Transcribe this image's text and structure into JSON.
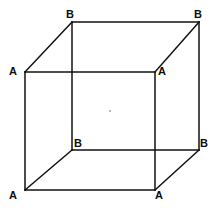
{
  "figure": {
    "kind": "cube-wireframe-diagram",
    "canvas": {
      "width": 216,
      "height": 210
    },
    "background_color": "#ffffff",
    "stroke_color": "#111111",
    "stroke_width": 1.5,
    "label_color": "#0d0d0d"
  },
  "chart_data": {
    "type": "diagram",
    "xlabel": "",
    "ylabel": "",
    "projection": "oblique/cabinet",
    "vertices": [
      {
        "id": "front-top-left",
        "label": "A",
        "x": 25,
        "y": 72,
        "face": "front",
        "label_x": 9,
        "label_y": 66
      },
      {
        "id": "front-top-right",
        "label": "A",
        "x": 155,
        "y": 72,
        "face": "front",
        "label_x": 158,
        "label_y": 66
      },
      {
        "id": "front-bottom-left",
        "label": "A",
        "x": 25,
        "y": 190,
        "face": "front",
        "label_x": 9,
        "label_y": 190
      },
      {
        "id": "front-bottom-right",
        "label": "A",
        "x": 155,
        "y": 190,
        "face": "front",
        "label_x": 155,
        "label_y": 190
      },
      {
        "id": "back-top-left",
        "label": "B",
        "x": 72,
        "y": 22,
        "face": "back",
        "label_x": 66,
        "label_y": 9
      },
      {
        "id": "back-top-right",
        "label": "B",
        "x": 199,
        "y": 22,
        "face": "back",
        "label_x": 194,
        "label_y": 9
      },
      {
        "id": "back-bottom-left",
        "label": "B",
        "x": 72,
        "y": 150,
        "face": "back",
        "label_x": 74,
        "label_y": 138
      },
      {
        "id": "back-bottom-right",
        "label": "B",
        "x": 199,
        "y": 150,
        "face": "back",
        "label_x": 200,
        "label_y": 138
      }
    ],
    "edges": [
      {
        "id": "front-top",
        "from": "front-top-left",
        "to": "front-top-right",
        "style": "solid"
      },
      {
        "id": "front-right",
        "from": "front-top-right",
        "to": "front-bottom-right",
        "style": "solid"
      },
      {
        "id": "front-bottom",
        "from": "front-bottom-right",
        "to": "front-bottom-left",
        "style": "solid"
      },
      {
        "id": "front-left",
        "from": "front-bottom-left",
        "to": "front-top-left",
        "style": "solid"
      },
      {
        "id": "back-top",
        "from": "back-top-left",
        "to": "back-top-right",
        "style": "solid"
      },
      {
        "id": "back-right",
        "from": "back-top-right",
        "to": "back-bottom-right",
        "style": "solid"
      },
      {
        "id": "back-bottom",
        "from": "back-bottom-right",
        "to": "back-bottom-left",
        "style": "solid"
      },
      {
        "id": "back-left",
        "from": "back-bottom-left",
        "to": "back-top-left",
        "style": "solid"
      },
      {
        "id": "connect-top-left",
        "from": "front-top-left",
        "to": "back-top-left",
        "style": "solid"
      },
      {
        "id": "connect-top-right",
        "from": "front-top-right",
        "to": "back-top-right",
        "style": "solid"
      },
      {
        "id": "connect-bottom-left",
        "from": "front-bottom-left",
        "to": "back-bottom-left",
        "style": "solid"
      },
      {
        "id": "connect-bottom-right",
        "from": "front-bottom-right",
        "to": "back-bottom-right",
        "style": "solid"
      }
    ],
    "markers": [
      {
        "id": "center-dot",
        "x": 110,
        "y": 111,
        "r": 0.9,
        "color": "#9a9a9a"
      }
    ],
    "labels_summary": {
      "front_face_label": "A",
      "back_face_label": "B",
      "front_count": 4,
      "back_count": 4
    }
  }
}
